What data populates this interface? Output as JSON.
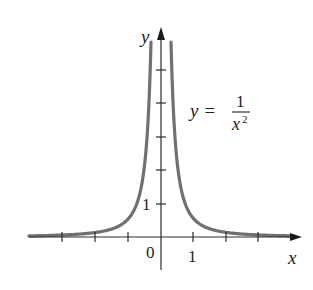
{
  "chart_data": {
    "type": "line",
    "title": "",
    "function": "y = 1/x^2",
    "equation_label": {
      "lhs": "y =",
      "numerator": "1",
      "denominator": "x",
      "exponent": "2"
    },
    "xlabel": "x",
    "ylabel": "y",
    "x_tick_labels": [
      {
        "value": 0,
        "label": "0"
      },
      {
        "value": 1,
        "label": "1"
      }
    ],
    "y_tick_labels": [
      {
        "value": 1,
        "label": "1"
      }
    ],
    "x_ticks": [
      -3,
      -2,
      -1,
      1,
      2,
      3
    ],
    "y_ticks": [
      1,
      2,
      3,
      4,
      5
    ],
    "xlim": [
      -4,
      4
    ],
    "ylim": [
      0,
      6
    ],
    "grid": false,
    "legend": "none",
    "series": [
      {
        "name": "y = 1/x^2 (x<0)",
        "x": [
          -4,
          -3,
          -2,
          -1.5,
          -1,
          -0.75,
          -0.5,
          -0.4,
          -0.33
        ],
        "values": [
          0.06,
          0.11,
          0.25,
          0.44,
          1,
          1.78,
          4,
          6.25,
          9
        ]
      },
      {
        "name": "y = 1/x^2 (x>0)",
        "x": [
          0.33,
          0.4,
          0.5,
          0.75,
          1,
          1.5,
          2,
          3,
          4
        ],
        "values": [
          9,
          6.25,
          4,
          1.78,
          1,
          0.44,
          0.25,
          0.11,
          0.06
        ]
      }
    ],
    "colors": {
      "curve": "#707070",
      "axis": "#2a2a2a",
      "text": "#222222"
    }
  }
}
